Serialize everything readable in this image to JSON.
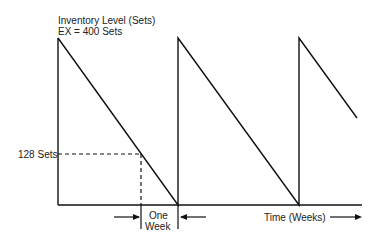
{
  "diagram": {
    "title_line1": "Inventory Level (Sets)",
    "title_line2": "EX = 400 Sets",
    "level_label": "128 Sets",
    "interval_label_line1": "One",
    "interval_label_line2": "Week",
    "x_axis_label": "Time (Weeks)",
    "colors": {
      "line": "#111111",
      "background": "#ffffff"
    }
  }
}
